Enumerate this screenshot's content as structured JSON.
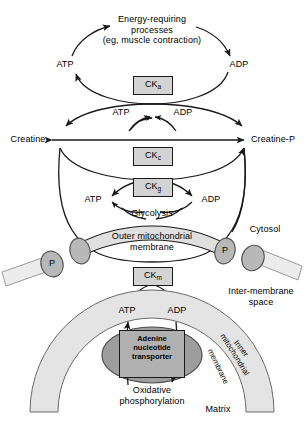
{
  "figure": {
    "background": "#ffffff",
    "membrane_fill": "#e0e0e0",
    "porin_fill": "#b8b8b8",
    "ck_box_fill": "#d3d3d3",
    "transporter_fill": "#b0b0b0",
    "stroke": "#1a1a1a"
  },
  "top_cycle": {
    "process_line1": "Energy-requiring",
    "process_line2": "processes",
    "process_line3": "(eg, muscle contraction)",
    "atp": "ATP",
    "adp": "ADP",
    "enzyme": "CK",
    "enzyme_sub": "a"
  },
  "cytosolic_cycle": {
    "atp": "ATP",
    "adp": "ADP",
    "creatine": "Creatine",
    "creatine_p": "Creatine-P",
    "enzyme": "CK",
    "enzyme_sub": "c"
  },
  "glycolysis_cycle": {
    "atp": "ATP",
    "adp": "ADP",
    "glycolysis": "Glycolysis",
    "enzyme": "CK",
    "enzyme_sub": "g"
  },
  "outer_membrane": {
    "label_line1": "Outer mitochondrial",
    "label_line2": "membrane",
    "porin_left_outer": "P",
    "porin_center_right": "P",
    "enzyme": "CK",
    "enzyme_sub": "m"
  },
  "compartments": {
    "cytosol": "Cytosol",
    "inter_membrane_line1": "Inter-membrane",
    "inter_membrane_line2": "space",
    "matrix": "Matrix",
    "inner_membrane_words": [
      "Inner",
      "mitochondrial",
      "membrane"
    ]
  },
  "matrix_section": {
    "atp": "ATP",
    "adp": "ADP",
    "transporter_line1": "Adenine",
    "transporter_line2": "nucleotide",
    "transporter_line3": "transporter",
    "oxphos_line1": "Oxidative",
    "oxphos_line2": "phosphorylation"
  }
}
